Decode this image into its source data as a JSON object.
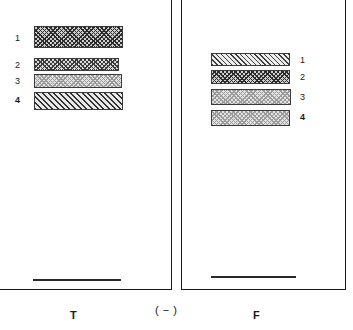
{
  "figure": {
    "kind": "electrophoresis-gel-diagram",
    "panels": [
      {
        "id": "left",
        "caption": "T",
        "bands": [
          {
            "label": "1",
            "pattern": "crosshatch-dark",
            "bold": false
          },
          {
            "label": "2",
            "pattern": "crosshatch-med",
            "bold": false
          },
          {
            "label": "3",
            "pattern": "stipple-light",
            "bold": false
          },
          {
            "label": "4",
            "pattern": "diagonal",
            "bold": true
          }
        ],
        "origin_line": true
      },
      {
        "id": "right",
        "caption": "F",
        "bands": [
          {
            "label": "1",
            "pattern": "diagonal-fine",
            "bold": false
          },
          {
            "label": "2",
            "pattern": "crosshatch-dark",
            "bold": false
          },
          {
            "label": "3",
            "pattern": "stipple-light",
            "bold": false
          },
          {
            "label": "4",
            "pattern": "stipple-light",
            "bold": true
          }
        ],
        "origin_line": true
      }
    ],
    "polarity_caption": "( − )",
    "colors": {
      "ink": "#1a1a1a",
      "band_outline": "#3a3a3a",
      "hatch_dark": "#2b2b2b",
      "hatch_medium": "#3a3a3a",
      "hatch_light": "#9a9a9a",
      "background": "#ffffff"
    }
  }
}
